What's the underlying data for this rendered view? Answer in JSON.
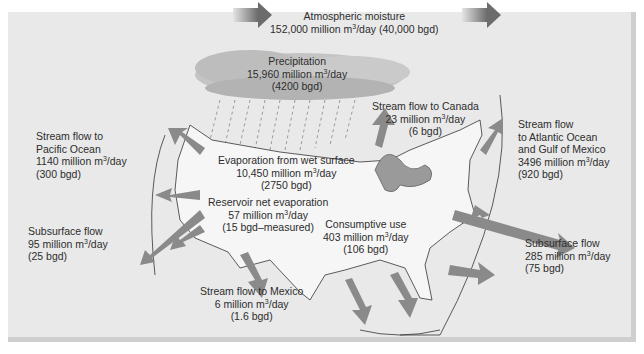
{
  "figure": {
    "atmospheric_moisture": {
      "label": "Atmospheric moisture",
      "value": "152,000 million m",
      "unit": "/day",
      "bgd": "(40,000 bgd)"
    },
    "precipitation": {
      "label": "Precipitation",
      "value": "15,960 million m",
      "unit": "/day",
      "bgd": "(4200 bgd)"
    },
    "stream_flow_canada": {
      "label": "Stream flow to Canada",
      "value": "23 million m",
      "unit": "/day",
      "bgd": "(6 bgd)"
    },
    "stream_flow_pacific": {
      "label1": "Stream flow to",
      "label2": "Pacific Ocean",
      "value": "1140 million m",
      "unit": "/day",
      "bgd": "(300 bgd)"
    },
    "stream_flow_atlantic": {
      "label1": "Stream flow",
      "label2": "to Atlantic Ocean",
      "label3": "and Gulf of Mexico",
      "value": "3496 million m",
      "unit": "/day",
      "bgd": "(920 bgd)"
    },
    "evaporation_wet_surface": {
      "label": "Evaporation from wet surface",
      "value": "10,450 million m",
      "unit": "/day",
      "bgd": "(2750 bgd)"
    },
    "reservoir_evaporation": {
      "label": "Reservoir net evaporation",
      "value": "57 million m",
      "unit": "/day",
      "bgd": "(15 bgd–measured)"
    },
    "consumptive_use": {
      "label": "Consumptive use",
      "value": "403 million m",
      "unit": "/day",
      "bgd": "(106 bgd)"
    },
    "subsurface_west": {
      "label": "Subsurface flow",
      "value": "95 million m",
      "unit": "/day",
      "bgd": "(25 bgd)"
    },
    "subsurface_east": {
      "label": "Subsurface flow",
      "value": "285 million m",
      "unit": "/day",
      "bgd": "(75 bgd)"
    },
    "stream_flow_mexico": {
      "label": "Stream flow to Mexico",
      "value": "6 million m",
      "unit": "/day",
      "bgd": "(1.6 bgd)"
    },
    "cubic": "3"
  },
  "colors": {
    "panel": "#e9e9e9",
    "map_fill": "#f7f7f7",
    "arrow": "#8a8a8a",
    "cloud": "#b8b8b8",
    "lakes": "#9a9a9a"
  }
}
